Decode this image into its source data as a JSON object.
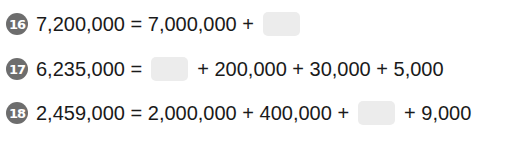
{
  "problems": [
    {
      "number": "16",
      "lhs": "7,200,000 = 7,000,000 +",
      "rhs": ""
    },
    {
      "number": "17",
      "lhs": "6,235,000 =",
      "rhs": "+ 200,000 + 30,000 + 5,000"
    },
    {
      "number": "18",
      "lhs": "2,459,000 = 2,000,000 + 400,000 +",
      "rhs": "+ 9,000"
    }
  ],
  "colors": {
    "badge": "#6d6d6d",
    "blank_box": "#ececec",
    "text": "#1a1a1a"
  }
}
